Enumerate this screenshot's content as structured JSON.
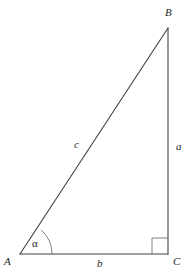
{
  "figure": {
    "type": "right-triangle-geometry-diagram",
    "background_color": "#ffffff",
    "stroke_color": "#404040",
    "text_color": "#231f20",
    "width": 193,
    "height": 276
  },
  "vertices": [
    {
      "id": "A",
      "label": "A",
      "x": 20,
      "y": 254,
      "label_x": 4,
      "label_y": 256
    },
    {
      "id": "B",
      "label": "B",
      "x": 168,
      "y": 28,
      "label_x": 165,
      "label_y": 7
    },
    {
      "id": "C",
      "label": "C",
      "x": 168,
      "y": 254,
      "label_x": 173,
      "label_y": 256
    }
  ],
  "sides": [
    {
      "id": "a",
      "label": "a",
      "from": "B",
      "to": "C",
      "role": "opposite-leg-vertical",
      "label_x": 176,
      "label_y": 141
    },
    {
      "id": "b",
      "label": "b",
      "from": "A",
      "to": "C",
      "role": "adjacent-leg-horizontal",
      "label_x": 97,
      "label_y": 258
    },
    {
      "id": "c",
      "label": "c",
      "from": "A",
      "to": "B",
      "role": "hypotenuse",
      "label_x": 74,
      "label_y": 139
    }
  ],
  "angles": [
    {
      "id": "alpha",
      "label": "α",
      "at_vertex": "A",
      "marker": "arc",
      "arc_radius": 32,
      "label_x": 32,
      "label_y": 238
    },
    {
      "id": "right-angle",
      "label": "",
      "at_vertex": "C",
      "marker": "square",
      "square_size": 16
    }
  ]
}
